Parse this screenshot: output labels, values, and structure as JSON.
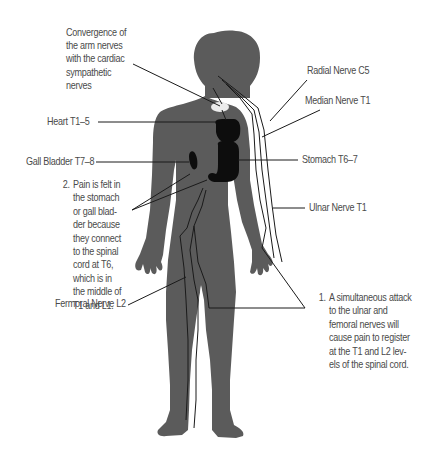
{
  "diagram": {
    "type": "anatomical referred-pain nerve diagram",
    "colors": {
      "body": "#5b5b5b",
      "organ": "#0d0d0d",
      "nerve_line": "#1a1a1a",
      "label_text": "#4a4a4a",
      "background": "#ffffff"
    },
    "labels": {
      "convergence": [
        "Convergence of",
        "the arm nerves",
        "with the cardiac",
        "sympathetic",
        "nerves"
      ],
      "radial": "Radial Nerve C5",
      "median": "Median Nerve T1",
      "heart": "Heart T1–5",
      "gall_bladder": "Gall Bladder T7–8",
      "stomach": "Stomach T6–7",
      "ulnar": "Ulnar Nerve T1",
      "femoral": "Fermoral Nerve L2"
    },
    "notes": [
      {
        "number": "2.",
        "lines": [
          "Pain is felt in",
          "the stomach",
          "or gall blad-",
          "der because",
          "they connect",
          "to the spinal",
          "cord at T6,",
          "which is in",
          "the middle of",
          "T1 and L1."
        ]
      },
      {
        "number": "1.",
        "lines": [
          "A simultaneous attack",
          "to the ulnar and",
          "femoral nerves will",
          "cause pain to register",
          "at the T1 and L2 lev-",
          "els of the spinal cord."
        ]
      }
    ]
  }
}
